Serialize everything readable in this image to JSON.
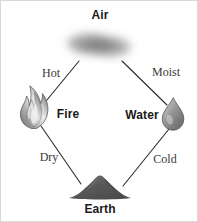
{
  "diagram": {
    "elements": [
      {
        "id": "air",
        "label": "Air",
        "icon": "cloud-icon",
        "x": 99,
        "y": 14
      },
      {
        "id": "fire",
        "label": "Fire",
        "icon": "flame-icon",
        "x": 67,
        "y": 113
      },
      {
        "id": "water",
        "label": "Water",
        "icon": "droplet-icon",
        "x": 141,
        "y": 114
      },
      {
        "id": "earth",
        "label": "Earth",
        "icon": "mound-icon",
        "x": 99,
        "y": 208
      }
    ],
    "qualities": [
      {
        "id": "hot",
        "label": "Hot",
        "between": "air-fire",
        "x": 50,
        "y": 72
      },
      {
        "id": "moist",
        "label": "Moist",
        "between": "air-water",
        "x": 165,
        "y": 71
      },
      {
        "id": "dry",
        "label": "Dry",
        "between": "fire-earth",
        "x": 48,
        "y": 156
      },
      {
        "id": "cold",
        "label": "Cold",
        "between": "water-earth",
        "x": 164,
        "y": 158
      }
    ],
    "connectors": [
      {
        "id": "air-fire",
        "from": "air",
        "to": "fire"
      },
      {
        "id": "air-water",
        "from": "air",
        "to": "water"
      },
      {
        "id": "fire-earth",
        "from": "fire",
        "to": "earth"
      },
      {
        "id": "water-earth",
        "from": "water",
        "to": "earth"
      }
    ],
    "colors": {
      "background": "#ffffff",
      "line": "#2b2b2b",
      "text": "#1a1a1a",
      "quality_text": "#3a3a3a",
      "air_gray": "#8f8f8f",
      "fire_gray": "#9a9a9a",
      "water_gray": "#8a8a8a",
      "earth_gray": "#5a5a5a",
      "border": "#d8d8d8"
    }
  }
}
